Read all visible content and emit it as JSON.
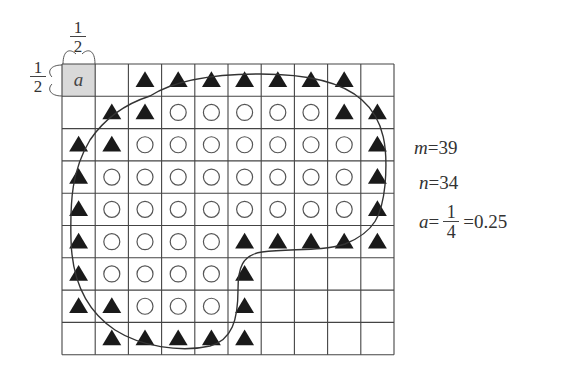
{
  "grid": {
    "rows": 9,
    "cols": 10,
    "origin": [
      62,
      64
    ],
    "cell_w": 33.2,
    "cell_h": 32.3,
    "line_color": "#444444",
    "highlight_cell": {
      "row": 0,
      "col": 0,
      "label": "a",
      "fill": "#d9d9d9"
    },
    "legend": {
      "T": "filled-triangle",
      "O": "open-circle",
      ".": "empty",
      "A": "unit-cell-a"
    },
    "cells": [
      "A.TTTTTTT.",
      ".TTOOOOOTT",
      "TTOOOOOOOT",
      "TOOOOOOOOT",
      "TOOOOOOOOT",
      "TOOOOTTTTT",
      "TOOOOT....",
      "TTOOOT....",
      ".TTTTT...."
    ]
  },
  "cell_side_labels": {
    "top": {
      "numerator": "1",
      "denominator": "2"
    },
    "left": {
      "numerator": "1",
      "denominator": "2"
    }
  },
  "results": {
    "m_label": "m",
    "m_value": "=39",
    "n_label": "n",
    "n_value": "=34",
    "a_label": "a",
    "a_eq": "=",
    "a_numerator": "1",
    "a_denominator": "4",
    "a_decimal": "=0.25"
  },
  "counts": {
    "circles": 39,
    "triangles": 34
  }
}
